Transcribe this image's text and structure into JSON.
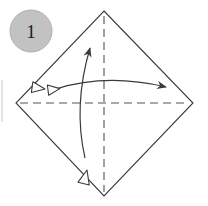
{
  "figure": {
    "step_number": "1",
    "background_color": "#ffffff"
  },
  "step_badge": {
    "name": "step-number-badge",
    "label": "1",
    "fill_color": "#c2c2c2",
    "stroke_color": "#b0b0b0",
    "text_color": "#1a1a1a",
    "center_x": 31,
    "center_y": 31,
    "radius": 21
  },
  "paper": {
    "name": "square-paper-diamond",
    "shape": "diamond",
    "stroke_color": "#3a3a3a",
    "fill_color": "#ffffff",
    "stroke_width": 1.1,
    "vertices": {
      "top": {
        "x": 104,
        "y": 11
      },
      "right": {
        "x": 193,
        "y": 103
      },
      "bottom": {
        "x": 104,
        "y": 196
      },
      "left": {
        "x": 16,
        "y": 103
      }
    }
  },
  "crease_lines": [
    {
      "name": "horizontal-crease-line",
      "orientation": "horizontal",
      "style": "dashed",
      "stroke_color": "#555555",
      "dash_pattern": "8 5",
      "x1": 20,
      "y1": 103,
      "x2": 189,
      "y2": 103
    },
    {
      "name": "vertical-crease-line",
      "orientation": "vertical",
      "style": "dashed",
      "stroke_color": "#555555",
      "dash_pattern": "8 5",
      "x1": 104,
      "y1": 16,
      "x2": 104,
      "y2": 192
    }
  ],
  "arrows": [
    {
      "name": "horizontal-fold-arrow",
      "direction": "left-right",
      "curve": "arc-bulging-up",
      "stroke_color": "#3a3a3a",
      "path": "M 56 89 Q 105 74 163 86",
      "head_start": {
        "type": "hollow-triangle",
        "x": 46,
        "y": 90
      },
      "head_end": {
        "type": "solid-thin-arrow",
        "x": 172,
        "y": 89
      }
    },
    {
      "name": "vertical-fold-arrow",
      "direction": "up-down",
      "curve": "arc-bulging-left",
      "stroke_color": "#3a3a3a",
      "path": "M 90 47 Q 74 108 85 155",
      "head_start": {
        "type": "solid-thin-arrow",
        "x": 93,
        "y": 38
      },
      "head_end": {
        "type": "hollow-triangle",
        "x": 88,
        "y": 166
      }
    }
  ],
  "edge_artifact": {
    "name": "page-edge-line",
    "visible": true,
    "stroke_color": "#dddddd",
    "x": 2,
    "y1": 80,
    "y2": 122
  }
}
